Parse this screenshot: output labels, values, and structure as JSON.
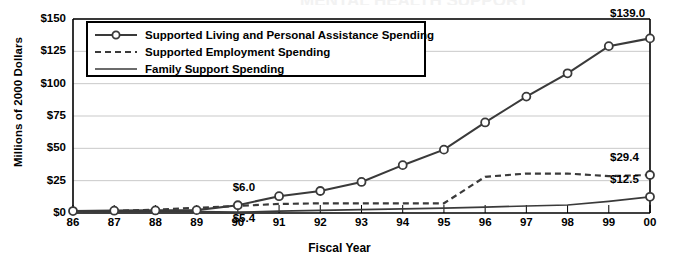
{
  "chart_data": {
    "type": "line",
    "title": "",
    "xlabel": "Fiscal Year",
    "ylabel": "Millions of 2000 Dollars",
    "categories": [
      "86",
      "87",
      "88",
      "89",
      "90",
      "91",
      "92",
      "93",
      "94",
      "95",
      "96",
      "97",
      "98",
      "99",
      "00"
    ],
    "ylim": [
      0,
      150
    ],
    "ytick_labels": [
      "$0",
      "$25",
      "$50",
      "$75",
      "$100",
      "$125",
      "$150"
    ],
    "ytick_values": [
      0,
      25,
      50,
      75,
      100,
      125,
      150
    ],
    "grid": true,
    "legend_position": "top-left",
    "series": [
      {
        "name": "Supported Living and Personal Assistance Spending",
        "style": "solid-with-circle-markers",
        "values": [
          1.5,
          1.8,
          2.0,
          2.2,
          6.0,
          13.0,
          17.0,
          24.0,
          37.0,
          49.0,
          70.0,
          90.0,
          108.0,
          129.0,
          135.0
        ]
      },
      {
        "name": "Supported Employment Spending",
        "style": "dashed",
        "values": [
          1.0,
          1.6,
          2.6,
          4.0,
          5.4,
          7.0,
          7.5,
          7.5,
          7.5,
          7.5,
          28.0,
          30.5,
          30.5,
          28.5,
          29.4
        ]
      },
      {
        "name": "Family Support Spending",
        "style": "solid",
        "values": [
          1.0,
          1.0,
          1.0,
          1.0,
          0.6,
          1.4,
          2.0,
          2.6,
          3.2,
          3.8,
          4.6,
          5.4,
          6.2,
          9.0,
          12.5
        ]
      }
    ],
    "annotations": [
      {
        "text": "$6.0",
        "series": "Supported Living and Personal Assistance Spending",
        "at": "90",
        "value": 6.0
      },
      {
        "text": "$5.4",
        "series": "Supported Employment Spending",
        "at": "90",
        "value": 5.4
      },
      {
        "text": "$139.0",
        "series": "Supported Living and Personal Assistance Spending",
        "at": "00",
        "value": 139.0
      },
      {
        "text": "$29.4",
        "series": "Supported Employment Spending",
        "at": "00",
        "value": 29.4
      },
      {
        "text": "$12.5",
        "series": "Family Support Spending",
        "at": "00",
        "value": 12.5
      }
    ]
  },
  "colors": {
    "line": "#3a3a3a",
    "grid": "#c9c9c9",
    "axis": "#000000",
    "marker_fill": "#ffffff",
    "background": "#ffffff"
  },
  "partial_title": "MENTAL HEALTH SUPPORT"
}
